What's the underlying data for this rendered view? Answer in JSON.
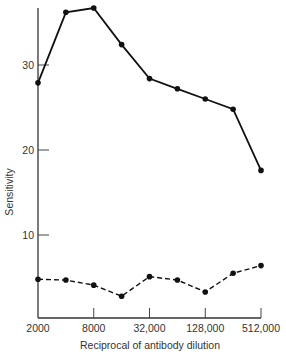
{
  "chart_data": {
    "type": "line",
    "title": "",
    "xlabel": "Reciprocal of antibody dilution",
    "ylabel": "Sensitivity",
    "x_scale": "log2",
    "x_tick_labels": [
      "2000",
      "8000",
      "32,000",
      "128,000",
      "512,000"
    ],
    "x_tick_values": [
      2000,
      8000,
      32000,
      128000,
      512000
    ],
    "x": [
      2000,
      4000,
      8000,
      16000,
      32000,
      64000,
      128000,
      256000,
      512000
    ],
    "y_ticks": [
      10,
      20,
      30
    ],
    "ylim": [
      0,
      37
    ],
    "grid": false,
    "legend": null,
    "series": [
      {
        "name": "upper (solid)",
        "style": "solid",
        "values": [
          27.9,
          36.2,
          36.7,
          32.4,
          28.4,
          27.2,
          26.0,
          24.8,
          17.6
        ]
      },
      {
        "name": "lower (dashed)",
        "style": "dashed",
        "values": [
          4.8,
          4.7,
          4.1,
          2.8,
          5.1,
          4.7,
          3.3,
          5.5,
          6.4
        ]
      }
    ]
  },
  "layout": {
    "plot_left": 38,
    "plot_right": 261,
    "plot_bottom": 318,
    "plot_top": 8,
    "y_zero_px": 320,
    "px_per_unit": 8.5
  }
}
